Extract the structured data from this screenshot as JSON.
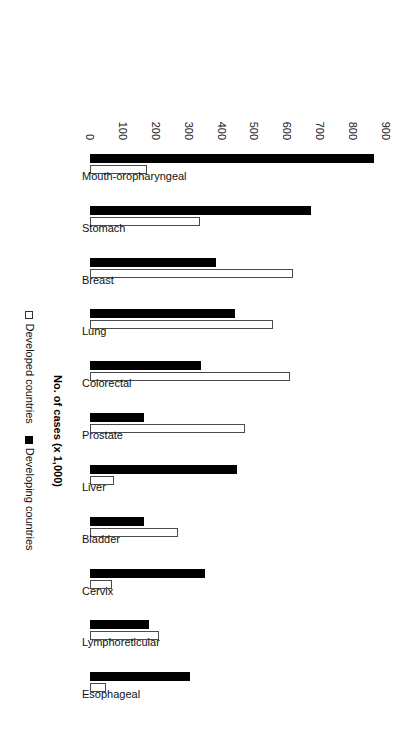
{
  "chart_data": {
    "type": "bar",
    "orientation": "horizontal-rotated",
    "title": "",
    "xlabel": "",
    "ylabel": "No. of cases (x 1,000)",
    "value_axis_label": "No. of cases (x 1,000)",
    "ylim": [
      0,
      900
    ],
    "grid": false,
    "legend_position": "bottom",
    "tick_labels": [
      "0",
      "100",
      "200",
      "300",
      "400",
      "500",
      "600",
      "700",
      "800",
      "900"
    ],
    "ticks": [
      0,
      100,
      200,
      300,
      400,
      500,
      600,
      700,
      800,
      900
    ],
    "categories": [
      "Mouth-oropharyngeal",
      "Stomach",
      "Breast",
      "Lung",
      "Colorectal",
      "Prostate",
      "Liver",
      "Bladder",
      "Cervix",
      "Lymphoreticular",
      "Esophageal"
    ],
    "series": [
      {
        "name": "Developed countries",
        "style": "open",
        "color": "#ffffff",
        "values": [
          173,
          334,
          618,
          555,
          607,
          471,
          74,
          267,
          66,
          211,
          50
        ]
      },
      {
        "name": "Developing countries",
        "style": "solid",
        "color": "#000000",
        "values": [
          864,
          673,
          382,
          442,
          338,
          164,
          448,
          164,
          350,
          180,
          303
        ]
      }
    ]
  },
  "legend": {
    "entries": [
      {
        "label": "Developed countries",
        "style": "open"
      },
      {
        "label": "Developing countries",
        "style": "solid"
      }
    ]
  },
  "colors": {
    "developed": "#ffffff",
    "developing": "#000000",
    "outline": "#4a4a4a",
    "background": "#ffffff",
    "text": "#111111"
  }
}
